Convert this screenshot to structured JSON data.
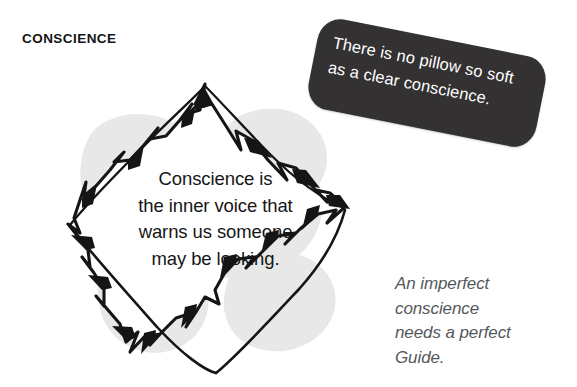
{
  "page": {
    "title": "CONSCIENCE",
    "background_color": "#ffffff"
  },
  "burst_quote": {
    "lines": [
      "Conscience is",
      "the inner voice that",
      "warns us someone",
      "may be looking."
    ],
    "text_color": "#161616"
  },
  "callout": {
    "lines": [
      "There is no pillow so soft",
      "as a clear conscience."
    ],
    "background_color": "#333132",
    "text_color": "#ffffff",
    "rotation_degrees": 11.2
  },
  "closing_note": {
    "lines": [
      "An imperfect",
      "conscience",
      "needs a perfect",
      "Guide."
    ],
    "text_color": "#55585a"
  },
  "decoration": {
    "blob_color": "#e8e8e8",
    "burst_outline_color": "#151515",
    "burst_fill_color": "#ffffff"
  }
}
